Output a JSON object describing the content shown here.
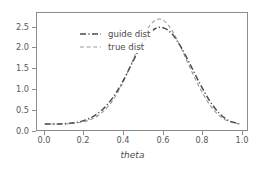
{
  "chart_data": {
    "type": "line",
    "title": "",
    "subtitle": "",
    "xlabel": "theta",
    "ylabel": "",
    "xlim": [
      -0.04,
      1.04
    ],
    "ylim": [
      -0.16,
      2.95
    ],
    "xticks": [
      "0.0",
      "0.2",
      "0.4",
      "0.6",
      "0.8",
      "1.0"
    ],
    "xtick_values": [
      0.0,
      0.2,
      0.4,
      0.6,
      0.8,
      1.0
    ],
    "yticks": [
      "0.0",
      "0.5",
      "1.0",
      "1.5",
      "2.0",
      "2.5"
    ],
    "ytick_values": [
      0.0,
      0.5,
      1.0,
      1.5,
      2.0,
      2.5
    ],
    "grid": false,
    "legend_position": "upper left",
    "series": [
      {
        "name": "guide dist",
        "color": "#4d4d4d",
        "linestyle": "dashdot",
        "linewidth": 1.6,
        "x": [
          0.0,
          0.05,
          0.1,
          0.15,
          0.2,
          0.25,
          0.3,
          0.35,
          0.4,
          0.45,
          0.5,
          0.55,
          0.6,
          0.65,
          0.7,
          0.75,
          0.8,
          0.85,
          0.9,
          0.95,
          1.0
        ],
        "y": [
          0.0,
          0.0,
          0.01,
          0.03,
          0.09,
          0.2,
          0.4,
          0.7,
          1.12,
          1.63,
          2.12,
          2.47,
          2.57,
          2.42,
          2.05,
          1.56,
          1.05,
          0.6,
          0.27,
          0.08,
          0.01
        ]
      },
      {
        "name": "true dist",
        "color": "#9a9a9a",
        "linestyle": "dashed",
        "linewidth": 1.1,
        "x": [
          0.0,
          0.05,
          0.1,
          0.15,
          0.2,
          0.25,
          0.3,
          0.35,
          0.4,
          0.45,
          0.5,
          0.55,
          0.6,
          0.65,
          0.7,
          0.75,
          0.8,
          0.85,
          0.9,
          0.95,
          1.0
        ],
        "y": [
          0.0,
          0.0,
          0.0,
          0.02,
          0.06,
          0.15,
          0.33,
          0.63,
          1.08,
          1.66,
          2.25,
          2.68,
          2.78,
          2.52,
          2.03,
          1.46,
          0.93,
          0.5,
          0.21,
          0.06,
          0.0
        ]
      }
    ]
  },
  "axes": {
    "xlabel": "theta",
    "xtick_labels": [
      "0.0",
      "0.2",
      "0.4",
      "0.6",
      "0.8",
      "1.0"
    ],
    "ytick_labels": [
      "0.0",
      "0.5",
      "1.0",
      "1.5",
      "2.0",
      "2.5"
    ]
  },
  "legend": {
    "entries": [
      {
        "label": "guide dist",
        "color": "#4d4d4d",
        "style": "dashdot"
      },
      {
        "label": "true dist",
        "color": "#9a9a9a",
        "style": "dashed"
      }
    ]
  },
  "colors": {
    "background": "#ffffff",
    "axis": "#8d8d8d",
    "text": "#575757",
    "guide": "#4d4d4d",
    "true": "#9a9a9a"
  }
}
